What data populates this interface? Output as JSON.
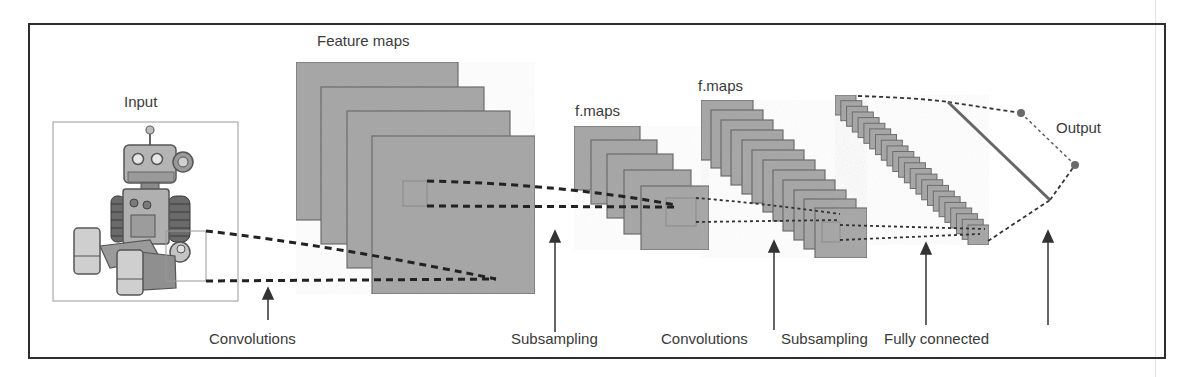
{
  "diagram": {
    "colors": {
      "map_fill": "#a8a8a8",
      "map_border": "#6e6e6e",
      "frame": "#2e2e2e",
      "text": "#3a3a3a",
      "dash": "#222222"
    },
    "top_labels": {
      "input": "Input",
      "feature_maps": "Feature maps",
      "fmaps_1": "f.maps",
      "fmaps_2": "f.maps",
      "output": "Output"
    },
    "stage_labels": [
      {
        "id": "conv1",
        "label": "Convolutions"
      },
      {
        "id": "sub1",
        "label": "Subsampling"
      },
      {
        "id": "conv2",
        "label": "Convolutions"
      },
      {
        "id": "sub2",
        "label": "Subsampling"
      },
      {
        "id": "fc",
        "label": "Fully connected"
      }
    ],
    "layers": [
      {
        "name": "input",
        "type": "image",
        "content": "robot-illustration"
      },
      {
        "name": "feature_maps",
        "count": 4
      },
      {
        "name": "f_maps_subsampled",
        "count": 5
      },
      {
        "name": "f_maps_conv2",
        "count": 12
      },
      {
        "name": "f_maps_subsampled_2",
        "count": 24
      },
      {
        "name": "fully_connected",
        "type": "line"
      },
      {
        "name": "output",
        "nodes": 2
      }
    ]
  }
}
